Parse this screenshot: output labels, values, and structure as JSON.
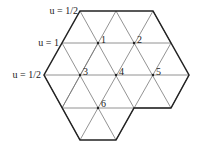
{
  "diagram": {
    "title": "",
    "boundary_labels": [
      {
        "text": "u = 1/2",
        "x": 44,
        "y": 14
      },
      {
        "text": "u = 1",
        "x": 58,
        "y": 46
      },
      {
        "text": "u = 1/2",
        "x": 40,
        "y": 78
      }
    ],
    "vertices": [
      {
        "label": "1",
        "x": 98,
        "y": 43
      },
      {
        "label": "2",
        "x": 134,
        "y": 43
      },
      {
        "label": "3",
        "x": 80,
        "y": 75
      },
      {
        "label": "4",
        "x": 116,
        "y": 75
      },
      {
        "label": "5",
        "x": 153,
        "y": 75
      },
      {
        "label": "6",
        "x": 98,
        "y": 108
      }
    ],
    "colors": {
      "boundary": "#222222",
      "grid": "#666666",
      "text": "#222222"
    }
  }
}
